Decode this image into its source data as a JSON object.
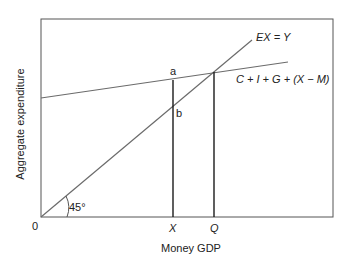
{
  "diagram": {
    "type": "keynesian-cross",
    "axes": {
      "x_label": "Money GDP",
      "y_label": "Aggregate expenditure",
      "origin_label": "0"
    },
    "lines": {
      "forty_five": {
        "label": "EX = Y",
        "angle_label": "45°"
      },
      "aggregate_expenditure": {
        "label": "C + I + G + (X − M)"
      }
    },
    "points": {
      "a": "a",
      "b": "b"
    },
    "x_ticks": {
      "x": "X",
      "q": "Q"
    },
    "colors": {
      "lines": "#6b6b6b",
      "verticals": "#1a1a1a",
      "frame": "#555555"
    }
  }
}
